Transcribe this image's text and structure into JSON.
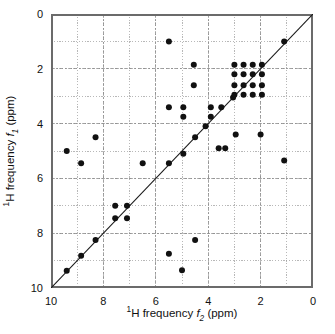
{
  "figure": {
    "background_color": "#ffffff",
    "marker_color": "#111111",
    "grid_color": "#9a9a9a",
    "axis_color": "#6b6b6b",
    "diagonal_color": "#1a1a1a"
  },
  "axes": {
    "x": {
      "title_prefix_sup": "1",
      "title_main": "H frequency ",
      "title_symbol": "f",
      "title_symbol_sub": "2",
      "title_units": " (ppm)",
      "title_plain": "1H frequency f2 (ppm)",
      "min": 10,
      "max": 0,
      "reversed": true,
      "ticks": [
        10,
        8,
        6,
        4,
        2,
        0
      ],
      "tick_labels": [
        "10",
        "8",
        "6",
        "4",
        "2",
        "0"
      ],
      "minor_gridline_step": 1
    },
    "y": {
      "title_prefix_sup": "1",
      "title_main": "H frequency ",
      "title_symbol": "f",
      "title_symbol_sub": "1",
      "title_units": " (ppm)",
      "title_plain": "1H frequency f1 (ppm)",
      "min": 0,
      "max": 10,
      "reversed": true,
      "ticks": [
        0,
        2,
        4,
        6,
        8,
        10
      ],
      "tick_labels": [
        "0",
        "2",
        "4",
        "6",
        "8",
        "10"
      ],
      "minor_gridline_step": 1
    }
  },
  "chart_data": {
    "type": "scatter",
    "title": "",
    "xlabel": "1H frequency f2 (ppm)",
    "ylabel": "1H frequency f1 (ppm)",
    "xlim": [
      10,
      0
    ],
    "ylim": [
      10,
      0
    ],
    "x_axis_inverted": true,
    "y_axis_inverted": true,
    "grid": true,
    "grid_spacing": 1,
    "legend": null,
    "marker": "filled-circle",
    "marker_size_px": 6,
    "annotations": [
      {
        "type": "line",
        "name": "diagonal",
        "from": [
          10,
          10
        ],
        "to": [
          0,
          0
        ]
      }
    ],
    "points": [
      [
        9.4,
        9.37
      ],
      [
        8.85,
        8.82
      ],
      [
        8.3,
        8.25
      ],
      [
        7.55,
        7.0
      ],
      [
        7.1,
        7.0
      ],
      [
        7.55,
        7.45
      ],
      [
        7.1,
        7.45
      ],
      [
        6.5,
        5.45
      ],
      [
        5.5,
        5.45
      ],
      [
        5.5,
        1.0
      ],
      [
        5.5,
        3.4
      ],
      [
        4.95,
        3.4
      ],
      [
        4.95,
        3.75
      ],
      [
        4.95,
        5.1
      ],
      [
        4.55,
        1.85
      ],
      [
        4.55,
        2.6
      ],
      [
        4.5,
        4.5
      ],
      [
        4.1,
        4.1
      ],
      [
        3.9,
        3.4
      ],
      [
        3.9,
        3.75
      ],
      [
        3.5,
        3.4
      ],
      [
        3.6,
        4.9
      ],
      [
        3.35,
        4.9
      ],
      [
        3.05,
        3.05
      ],
      [
        9.4,
        5.0
      ],
      [
        8.85,
        5.45
      ],
      [
        8.3,
        4.5
      ],
      [
        5.5,
        8.75
      ],
      [
        5.0,
        9.35
      ],
      [
        4.5,
        8.25
      ],
      [
        2.0,
        4.4
      ],
      [
        2.95,
        4.4
      ],
      [
        1.1,
        5.35
      ],
      [
        1.1,
        1.0
      ],
      [
        3.0,
        1.85
      ],
      [
        2.65,
        1.85
      ],
      [
        2.3,
        1.85
      ],
      [
        1.95,
        1.85
      ],
      [
        3.0,
        2.2
      ],
      [
        2.65,
        2.2
      ],
      [
        2.3,
        2.2
      ],
      [
        1.95,
        2.2
      ],
      [
        3.0,
        2.6
      ],
      [
        2.65,
        2.6
      ],
      [
        2.3,
        2.6
      ],
      [
        1.95,
        2.6
      ],
      [
        3.0,
        2.95
      ],
      [
        2.65,
        2.95
      ],
      [
        2.3,
        2.95
      ],
      [
        1.95,
        2.95
      ]
    ]
  }
}
